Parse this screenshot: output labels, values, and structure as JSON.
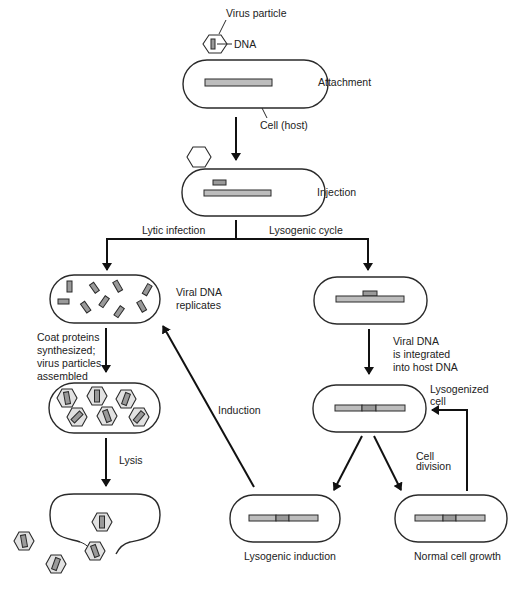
{
  "diagram": {
    "colors": {
      "outline": "#2a2a2a",
      "arrow": "#111111",
      "host_dna": "#bdbdbd",
      "viral_dna": "#9a9a9a",
      "capsid_fill": "#e2e2e2",
      "background": "#ffffff"
    },
    "labels": {
      "virus_particle": "Virus particle",
      "dna": "DNA",
      "attachment": "Attachment",
      "cell_host": "Cell (host)",
      "injection": "Injection",
      "lytic_infection": "Lytic infection",
      "lysogenic_cycle": "Lysogenic cycle",
      "viral_dna_replicates_1": "Viral DNA",
      "viral_dna_replicates_2": "replicates",
      "coat_proteins_1": "Coat proteins",
      "coat_proteins_2": "synthesized;",
      "coat_proteins_3": "virus particles",
      "coat_proteins_4": "assembled",
      "lysis": "Lysis",
      "induction": "Induction",
      "integrated_1": "Viral DNA",
      "integrated_2": "is integrated",
      "integrated_3": "into host DNA",
      "lysogenized_1": "Lysogenized",
      "lysogenized_2": "cell",
      "cell_division_1": "Cell",
      "cell_division_2": "division",
      "lysogenic_induction": "Lysogenic induction",
      "normal_cell_growth": "Normal cell growth"
    },
    "stages": [
      {
        "id": "attachment",
        "label": "Attachment"
      },
      {
        "id": "injection",
        "label": "Injection"
      },
      {
        "id": "viral-dna-replicates",
        "label": "Viral DNA replicates"
      },
      {
        "id": "assembly",
        "label": "Coat proteins synthesized; virus particles assembled"
      },
      {
        "id": "lysis",
        "label": "Lysis"
      },
      {
        "id": "integration",
        "label": "Viral DNA is integrated into host DNA"
      },
      {
        "id": "lysogenized-cell",
        "label": "Lysogenized cell"
      },
      {
        "id": "lysogenic-induction",
        "label": "Lysogenic induction"
      },
      {
        "id": "normal-cell-growth",
        "label": "Normal cell growth"
      }
    ]
  }
}
